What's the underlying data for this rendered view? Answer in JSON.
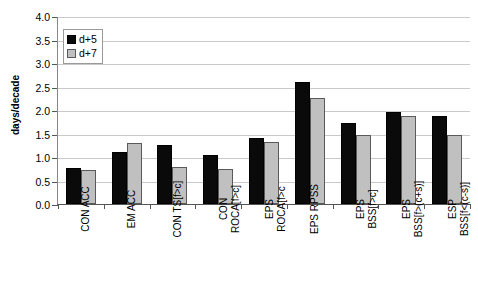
{
  "chart_data": {
    "type": "bar",
    "title": "",
    "xlabel": "",
    "ylabel": "days/decade",
    "ylim": [
      0.0,
      4.0
    ],
    "ytick_step": 0.5,
    "ytick_labels": [
      "0.0",
      "0.5",
      "1.0",
      "1.5",
      "2.0",
      "2.5",
      "3.0",
      "3.5",
      "4.0"
    ],
    "grid": true,
    "legend_position": "top-left",
    "categories": [
      "CON ACC",
      "EM ACC",
      "CON TS[f>c]",
      "CON ROCA[f>c]",
      "EPS ROCA[f>c",
      "EPS RPSS",
      "EPS BSS[f>c]",
      "EPS BSS[f>(c+s)]",
      "ESP BSS[f<(c-s)]"
    ],
    "category_lines": [
      [
        "CON ACC",
        ""
      ],
      [
        "EM ACC",
        ""
      ],
      [
        "CON TS[f>c]",
        ""
      ],
      [
        "CON",
        "ROCA[f>c]"
      ],
      [
        "EPS",
        "ROCA[f>c"
      ],
      [
        "EPS RPSS",
        ""
      ],
      [
        "EPS",
        "BSS[f>c]"
      ],
      [
        "EPS",
        "BSS[f>(c+s)]"
      ],
      [
        "ESP",
        "BSS[f<(c-s)]"
      ]
    ],
    "series": [
      {
        "name": "d+5",
        "color": "#000000",
        "values": [
          0.77,
          1.1,
          1.25,
          1.05,
          1.4,
          2.6,
          1.73,
          1.95,
          1.87
        ]
      },
      {
        "name": "d+7",
        "color": "#c0c0c0",
        "values": [
          0.73,
          1.3,
          0.78,
          0.75,
          1.32,
          2.25,
          1.47,
          1.87,
          1.47
        ]
      }
    ]
  },
  "legend": {
    "items": [
      {
        "label": "d+5"
      },
      {
        "label": "d+7"
      }
    ]
  }
}
